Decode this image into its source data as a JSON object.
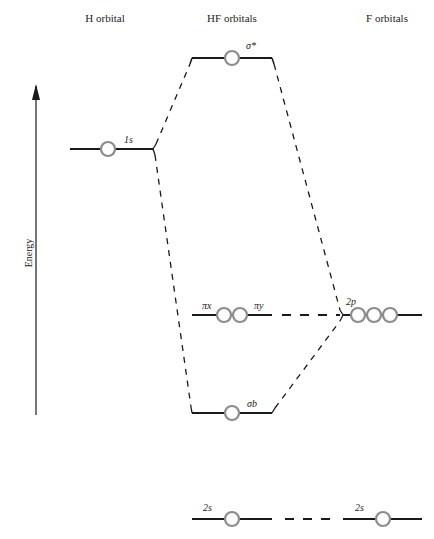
{
  "diagram": {
    "type": "molecular-orbital-energy-diagram",
    "columns": {
      "left": "H orbital",
      "center": "HF orbitals",
      "right": "F orbitals"
    },
    "axis": {
      "label": "Energy",
      "direction": "up"
    },
    "levels": {
      "sigma_star": {
        "label": "σ*",
        "electrons_circles": 1
      },
      "h_1s": {
        "label": "1s",
        "electrons_circles": 1
      },
      "pi_x": {
        "label": "πx"
      },
      "pi_y": {
        "label": "πy"
      },
      "pi_circles": 2,
      "f_2p": {
        "label": "2p",
        "electrons_circles": 3
      },
      "sigma_b": {
        "label": "σb",
        "electrons_circles": 1
      },
      "hf_2s": {
        "label": "2s",
        "electrons_circles": 1
      },
      "f_2s": {
        "label": "2s",
        "electrons_circles": 1
      }
    },
    "colors": {
      "line": "#1a1a1a",
      "circle": "#8c8c8c"
    }
  }
}
